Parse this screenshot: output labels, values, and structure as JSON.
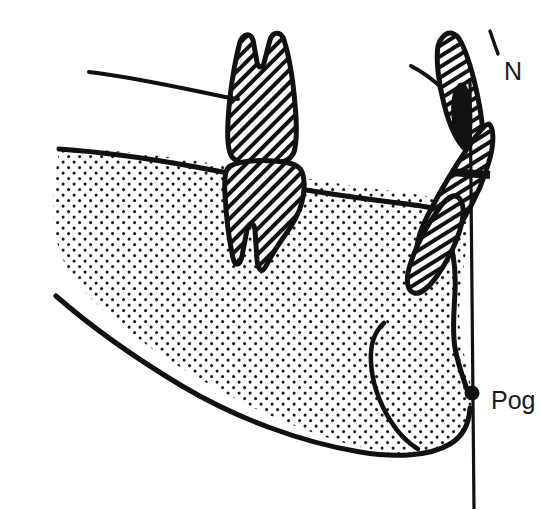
{
  "figure": {
    "background_color": "#ffffff",
    "ink_color": "#111111",
    "stipple_color": "#1a1a1a",
    "hatch_color": "#111111",
    "width": 556,
    "height": 510
  },
  "labels": [
    {
      "id": "n-point",
      "text": "N",
      "x": 504,
      "y": 80,
      "font_size": 25,
      "description": "Nasion reference landmark label"
    },
    {
      "id": "pog-point",
      "text": "Pog",
      "x": 491,
      "y": 409,
      "font_size": 25,
      "description": "Pogonion reference landmark label"
    }
  ],
  "landmarks": [
    {
      "id": "pogonion-dot",
      "name": "pogonion-marker",
      "cx": 472,
      "cy": 393,
      "r": 7,
      "color": "#111111"
    }
  ],
  "reference_lines": [
    {
      "id": "facial-vertical-line",
      "name": "facial-plane-vertical-reference",
      "x1": 470,
      "y1": 78,
      "x2": 474,
      "y2": 508,
      "stroke_width": 3
    },
    {
      "id": "n-tick",
      "name": "nasion-tick-mark",
      "x1": 489,
      "y1": 31,
      "x2": 497,
      "y2": 53,
      "stroke_width": 3
    },
    {
      "id": "overjet-tick",
      "name": "horizontal-incisal-tick",
      "x1": 452,
      "y1": 172,
      "x2": 489,
      "y2": 175,
      "stroke_width": 7
    }
  ],
  "structures": [
    {
      "id": "mandible-body",
      "name": "mandible-outline",
      "fill": "stipple"
    },
    {
      "id": "symphysis-line",
      "name": "symphysis-inner-contour",
      "fill": "none"
    },
    {
      "id": "upper-molar",
      "name": "maxillary-molar-tooth",
      "fill": "hatch"
    },
    {
      "id": "lower-molar",
      "name": "mandibular-molar-tooth",
      "fill": "hatch"
    },
    {
      "id": "upper-incisor",
      "name": "maxillary-incisor-tooth",
      "fill": "hatch"
    },
    {
      "id": "lower-incisor",
      "name": "mandibular-incisor-tooth",
      "fill": "hatch"
    },
    {
      "id": "palatal-line",
      "name": "palatal-plane-line",
      "fill": "none"
    },
    {
      "id": "maxilla-curve",
      "name": "anterior-maxilla-contour",
      "fill": "none"
    },
    {
      "id": "incisal-wedge",
      "name": "incisal-overlap-wedge",
      "fill": "solid"
    }
  ]
}
